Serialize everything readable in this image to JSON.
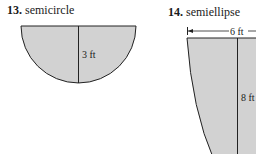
{
  "problems": [
    {
      "number": "13.",
      "name": "semicircle",
      "measurements": [
        {
          "label": "3 ft",
          "dimension": "radius (vertical)"
        }
      ]
    },
    {
      "number": "14.",
      "name": "semiellipse",
      "measurements": [
        {
          "label": "6 ft",
          "dimension": "width (top, dimension arrow)"
        },
        {
          "label": "8 ft",
          "dimension": "depth (vertical)"
        }
      ]
    }
  ],
  "colors": {
    "fill": "#d2d2d2",
    "stroke": "#222222"
  }
}
